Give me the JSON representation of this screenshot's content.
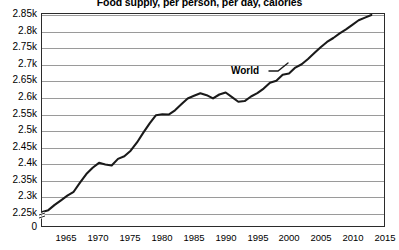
{
  "chart_data": {
    "type": "line",
    "title": "Food supply, per person, per day, calories",
    "xlabel": "",
    "ylabel": "",
    "xlim": [
      1961,
      2015
    ],
    "ylim": [
      2250,
      2850
    ],
    "grid": true,
    "legend_position": "inline-annotation",
    "y_axis_break_at_zero": true,
    "y_tick_labels": [
      "2.85k",
      "2.8k",
      "2.75k",
      "2.7k",
      "2.65k",
      "2.6k",
      "2.55k",
      "2.5k",
      "2.45k",
      "2.4k",
      "2.35k",
      "2.3k",
      "2.25k",
      "0"
    ],
    "y_tick_values": [
      2850,
      2800,
      2750,
      2700,
      2650,
      2600,
      2550,
      2500,
      2450,
      2400,
      2350,
      2300,
      2250,
      0
    ],
    "x_tick_labels": [
      "1965",
      "1970",
      "1975",
      "1980",
      "1985",
      "1990",
      "1995",
      "2000",
      "2005",
      "2010",
      "2015"
    ],
    "x_tick_values": [
      1965,
      1970,
      1975,
      1980,
      1985,
      1990,
      1995,
      2000,
      2005,
      2010,
      2015
    ],
    "series": [
      {
        "name": "World",
        "color": "#1a1a1a",
        "annotation": "World",
        "x": [
          1961,
          1962,
          1963,
          1964,
          1965,
          1966,
          1967,
          1968,
          1969,
          1970,
          1971,
          1972,
          1973,
          1974,
          1975,
          1976,
          1977,
          1978,
          1979,
          1980,
          1981,
          1982,
          1983,
          1984,
          1985,
          1986,
          1987,
          1988,
          1989,
          1990,
          1991,
          1992,
          1993,
          1994,
          1995,
          1996,
          1997,
          1998,
          1999,
          2000,
          2001,
          2002,
          2003,
          2004,
          2005,
          2006,
          2007,
          2008,
          2009,
          2010,
          2011,
          2012,
          2013
        ],
        "values": [
          2250,
          2256,
          2272,
          2286,
          2300,
          2312,
          2340,
          2366,
          2385,
          2400,
          2395,
          2392,
          2412,
          2420,
          2437,
          2462,
          2492,
          2520,
          2545,
          2548,
          2547,
          2560,
          2578,
          2596,
          2604,
          2612,
          2606,
          2596,
          2608,
          2614,
          2600,
          2586,
          2588,
          2602,
          2612,
          2626,
          2644,
          2650,
          2668,
          2672,
          2690,
          2700,
          2716,
          2734,
          2752,
          2768,
          2780,
          2794,
          2806,
          2820,
          2834,
          2842,
          2850
        ]
      }
    ]
  }
}
